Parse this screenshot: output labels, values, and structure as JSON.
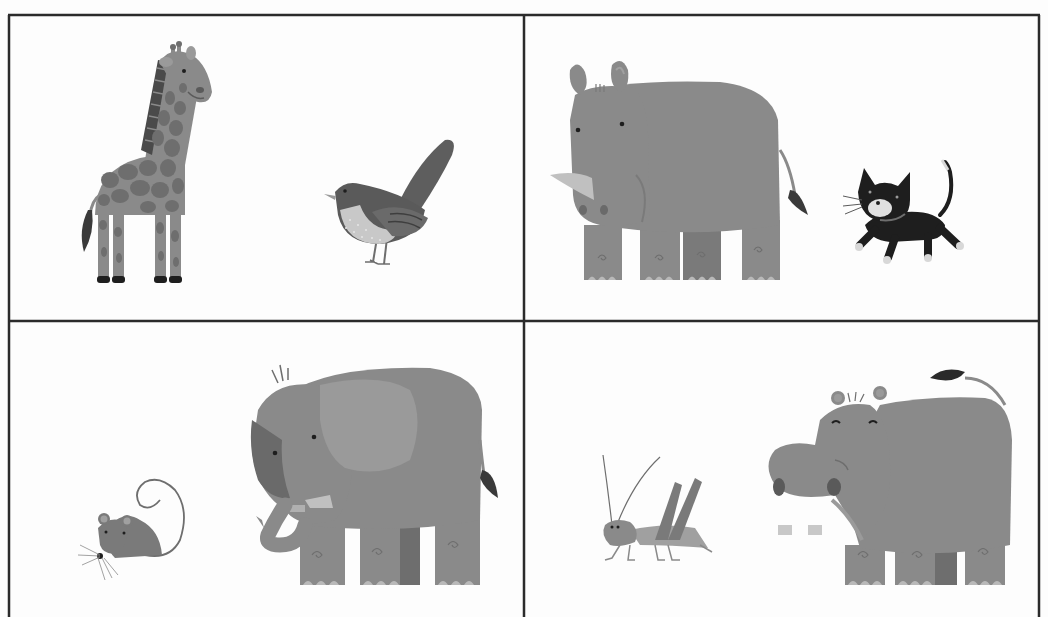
{
  "figure": {
    "layout": "2x2 grid of animal illustrations",
    "style": "grayscale flat illustration",
    "panels": [
      {
        "position": "top-left",
        "animals": [
          "giraffe",
          "bird"
        ]
      },
      {
        "position": "top-right",
        "animals": [
          "rhinoceros",
          "cat"
        ]
      },
      {
        "position": "bottom-left",
        "animals": [
          "mouse",
          "elephant"
        ]
      },
      {
        "position": "bottom-right",
        "animals": [
          "grasshopper",
          "hippopotamus"
        ]
      }
    ]
  },
  "colors": {
    "background": "#fdfdfd",
    "border": "#2b2b2b",
    "body_gray": "#8a8a8a",
    "dark_gray": "#6e6e6e",
    "light_gray": "#b9b9b9",
    "black": "#1e1e1e"
  }
}
